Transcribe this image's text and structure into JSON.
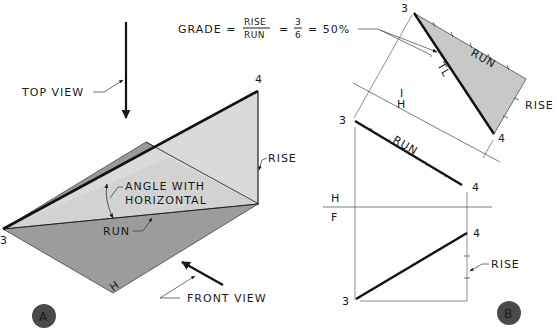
{
  "formula": {
    "lhs": "GRADE =",
    "frac1_num": "RISE",
    "frac1_den": "RUN",
    "eq2": "=",
    "frac2_num": "3",
    "frac2_den": "6",
    "result": "= 50%"
  },
  "view_a": {
    "badge": "A",
    "top_view_label": "TOP VIEW",
    "front_view_label": "FRONT VIEW",
    "rise_label": "RISE",
    "run_label": "RUN",
    "angle_label_line1": "ANGLE WITH",
    "angle_label_line2": "HORIZONTAL",
    "point_3": "3",
    "point_4": "4",
    "plane_label": "H"
  },
  "view_b": {
    "badge": "B",
    "aux_point_3": "3",
    "aux_point_4": "4",
    "aux_run_label": "RUN",
    "aux_rise_label": "RISE",
    "tl_label": "TL",
    "fold_h": "H",
    "fold_1": "I",
    "top_point_3": "3",
    "top_point_4": "4",
    "top_run_label": "RUN",
    "fold_h2": "H",
    "fold_f": "F",
    "front_point_4": "4",
    "front_point_3": "3",
    "front_rise_label": "RISE"
  },
  "colors": {
    "dark_shade": "#8f8f8f",
    "mid_shade": "#a6a6a6",
    "light_shade": "#d4d4d4",
    "aux_fill": "#c8c8c8",
    "badge_fill": "#4a4a4a",
    "line": "#1a1a1a"
  }
}
